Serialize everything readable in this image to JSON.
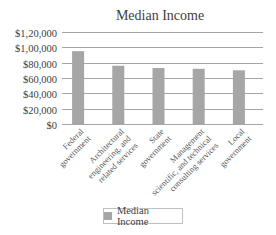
{
  "chart_data": {
    "type": "bar",
    "title": "Median Income",
    "xlabel": "",
    "ylabel": "",
    "categories": [
      [
        "Federal",
        "government"
      ],
      [
        "Architectural",
        "engineering, and",
        "related services"
      ],
      [
        "State",
        "government"
      ],
      [
        "Management",
        "scientific, and technical",
        "consulting services"
      ],
      [
        "Local",
        "government"
      ]
    ],
    "category_names": [
      "Federal government",
      "Architectural engineering, and related services",
      "State government",
      "Management scientific, and technical consulting services",
      "Local government"
    ],
    "series": [
      {
        "name": "Median Income",
        "color": "#a6a6a6",
        "values": [
          95000,
          76000,
          73000,
          72000,
          70000
        ]
      }
    ],
    "ylim": [
      0,
      120000
    ],
    "yticks": [
      0,
      20000,
      40000,
      60000,
      80000,
      100000,
      120000
    ],
    "ytick_labels": [
      "$0",
      "$20,000",
      "$40,000",
      "$60,000",
      "$80,000",
      "$1,00,000",
      "$1,20,000"
    ],
    "grid": true,
    "legend": {
      "position": "bottom",
      "entries": [
        "Median Income"
      ]
    }
  }
}
